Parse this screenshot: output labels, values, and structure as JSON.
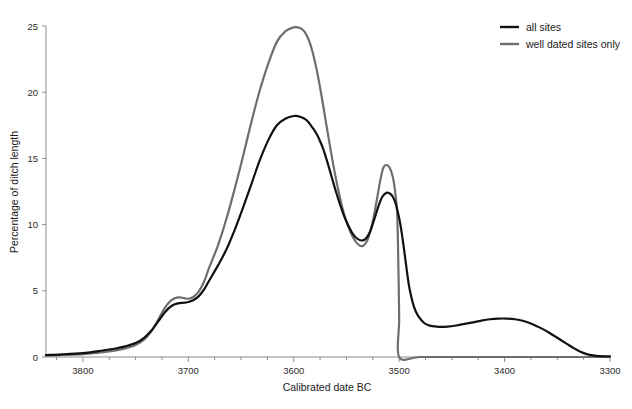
{
  "chart_data": {
    "type": "line",
    "title": "",
    "xlabel": "Calibrated date BC",
    "ylabel": "Percentage of ditch length",
    "xlim": [
      3835,
      3300
    ],
    "ylim": [
      0,
      25
    ],
    "x_reversed": true,
    "grid": false,
    "legend_position": "top-right",
    "x_major_ticks": [
      3800,
      3700,
      3600,
      3500,
      3400,
      3300
    ],
    "x_major_tick_labels": [
      "3800",
      "3700",
      "3600",
      "3500",
      "3400",
      "3300"
    ],
    "x_minor_tick_step": 25,
    "y_ticks": [
      0,
      5,
      10,
      15,
      20,
      25
    ],
    "y_tick_labels": [
      "0",
      "5",
      "10",
      "15",
      "20",
      "25"
    ],
    "series": [
      {
        "name": "all sites",
        "color": "#111111",
        "width": 2.2,
        "x": [
          3835,
          3820,
          3800,
          3785,
          3770,
          3760,
          3750,
          3742,
          3735,
          3728,
          3722,
          3716,
          3710,
          3704,
          3700,
          3695,
          3690,
          3685,
          3680,
          3672,
          3664,
          3656,
          3648,
          3640,
          3632,
          3624,
          3616,
          3608,
          3600,
          3594,
          3588,
          3582,
          3578,
          3575,
          3572,
          3568,
          3564,
          3560,
          3556,
          3552,
          3548,
          3544,
          3540,
          3536,
          3532,
          3528,
          3524,
          3520,
          3516,
          3512,
          3509,
          3506,
          3503,
          3500,
          3498,
          3496,
          3494,
          3492,
          3490,
          3486,
          3482,
          3476,
          3470,
          3462,
          3454,
          3446,
          3438,
          3430,
          3422,
          3414,
          3406,
          3398,
          3390,
          3382,
          3374,
          3366,
          3358,
          3350,
          3342,
          3334,
          3328,
          3322,
          3316,
          3310,
          3300
        ],
        "y": [
          0.15,
          0.2,
          0.3,
          0.45,
          0.62,
          0.8,
          1.05,
          1.45,
          2.0,
          2.75,
          3.4,
          3.85,
          4.05,
          4.1,
          4.15,
          4.3,
          4.6,
          5.1,
          5.8,
          6.9,
          8.1,
          9.6,
          11.3,
          13.1,
          14.9,
          16.4,
          17.5,
          18.0,
          18.2,
          18.15,
          17.9,
          17.3,
          16.8,
          16.3,
          15.7,
          14.7,
          13.6,
          12.5,
          11.5,
          10.6,
          9.9,
          9.3,
          8.95,
          8.8,
          8.9,
          9.4,
          10.3,
          11.3,
          12.1,
          12.4,
          12.35,
          12.1,
          11.5,
          10.5,
          9.6,
          8.5,
          7.3,
          6.1,
          5.1,
          3.8,
          3.1,
          2.55,
          2.35,
          2.28,
          2.3,
          2.38,
          2.5,
          2.62,
          2.75,
          2.85,
          2.9,
          2.9,
          2.85,
          2.72,
          2.5,
          2.2,
          1.85,
          1.45,
          1.05,
          0.65,
          0.4,
          0.22,
          0.12,
          0.07,
          0.05
        ]
      },
      {
        "name": "well dated sites only",
        "color": "#6e6e6e",
        "width": 2.2,
        "x": [
          3835,
          3820,
          3800,
          3785,
          3770,
          3760,
          3750,
          3742,
          3735,
          3728,
          3722,
          3716,
          3710,
          3704,
          3700,
          3695,
          3690,
          3685,
          3680,
          3672,
          3664,
          3656,
          3648,
          3640,
          3632,
          3624,
          3616,
          3608,
          3600,
          3594,
          3590,
          3586,
          3582,
          3578,
          3574,
          3570,
          3566,
          3562,
          3558,
          3554,
          3550,
          3546,
          3542,
          3538,
          3534,
          3530,
          3526,
          3522,
          3518,
          3515,
          3512,
          3509,
          3506,
          3504,
          3502,
          3501,
          3500,
          3500,
          3480,
          3440,
          3400,
          3360,
          3330,
          3300
        ],
        "y": [
          0.1,
          0.15,
          0.22,
          0.32,
          0.48,
          0.65,
          0.9,
          1.3,
          1.95,
          2.9,
          3.75,
          4.3,
          4.5,
          4.45,
          4.4,
          4.55,
          4.95,
          5.7,
          6.8,
          8.4,
          10.4,
          12.7,
          15.2,
          17.8,
          20.2,
          22.2,
          23.8,
          24.6,
          24.9,
          24.85,
          24.6,
          24.0,
          23.0,
          21.6,
          19.9,
          18.0,
          16.1,
          14.3,
          12.7,
          11.3,
          10.2,
          9.4,
          8.8,
          8.45,
          8.4,
          8.85,
          9.9,
          11.5,
          13.3,
          14.3,
          14.5,
          14.3,
          13.6,
          12.6,
          11.0,
          8.0,
          3.0,
          0.0,
          0.0,
          0.0,
          0.0,
          0.0,
          0.0,
          0.0
        ]
      }
    ]
  },
  "legend": {
    "items": [
      {
        "label": "all sites",
        "color": "#111111"
      },
      {
        "label": "well dated sites only",
        "color": "#6e6e6e"
      }
    ]
  },
  "axes": {
    "x_title": "Calibrated date BC",
    "y_title": "Percentage of ditch length"
  }
}
